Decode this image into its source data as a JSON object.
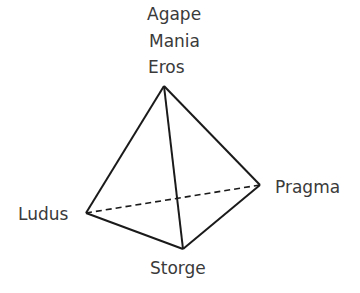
{
  "diagram": {
    "type": "tetrahedron",
    "apex_labels": [
      "Agape",
      "Mania",
      "Eros"
    ],
    "vertices": {
      "apex": {
        "label": "Eros",
        "x": 164,
        "y": 86
      },
      "left": {
        "label": "Ludus",
        "x": 86,
        "y": 213
      },
      "right": {
        "label": "Pragma",
        "x": 260,
        "y": 185
      },
      "bottom": {
        "label": "Storge",
        "x": 183,
        "y": 249
      }
    },
    "labels": {
      "agape": "Agape",
      "mania": "Mania",
      "eros": "Eros",
      "ludus": "Ludus",
      "pragma": "Pragma",
      "storge": "Storge"
    },
    "colors": {
      "line": "#1a1a1a",
      "text": "#3a3a3a"
    }
  }
}
